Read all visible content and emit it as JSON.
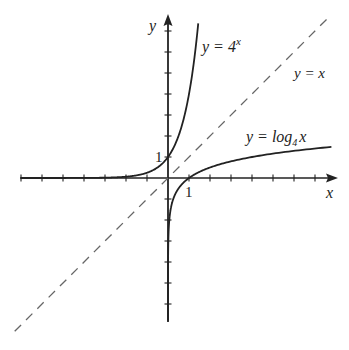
{
  "chart_data": {
    "type": "line",
    "title": "",
    "xlabel": "x",
    "ylabel": "y",
    "xlim": [
      -7,
      8
    ],
    "ylim": [
      -7,
      8
    ],
    "grid": false,
    "tick_labels": {
      "x": [
        "1"
      ],
      "y": [
        "1"
      ]
    },
    "series": [
      {
        "name": "y = 4^x",
        "label_main": "y = 4",
        "label_sup": "x",
        "style": "solid",
        "color": "#222222",
        "points": [
          [
            -7,
            6e-05
          ],
          [
            -3,
            0.0156
          ],
          [
            -2,
            0.0625
          ],
          [
            -1,
            0.25
          ],
          [
            0,
            1
          ],
          [
            0.5,
            2
          ],
          [
            1,
            4
          ],
          [
            1.5,
            8
          ]
        ]
      },
      {
        "name": "y = log_4 x",
        "label_main": "y = log",
        "label_sub": "4",
        "label_tail": "x",
        "style": "solid",
        "color": "#222222",
        "points": [
          [
            0.0002,
            -6.1
          ],
          [
            0.01,
            -3.3
          ],
          [
            0.1,
            -1.66
          ],
          [
            0.5,
            -0.5
          ],
          [
            1,
            0
          ],
          [
            2,
            0.5
          ],
          [
            4,
            1
          ],
          [
            8,
            1.5
          ]
        ]
      },
      {
        "name": "y = x",
        "label_main": "y = x",
        "style": "dashed",
        "color": "#666666",
        "points": [
          [
            -7,
            -7
          ],
          [
            8,
            8
          ]
        ]
      }
    ],
    "axis_labels": {
      "x": "x",
      "y": "y"
    },
    "tick_one": "1"
  }
}
